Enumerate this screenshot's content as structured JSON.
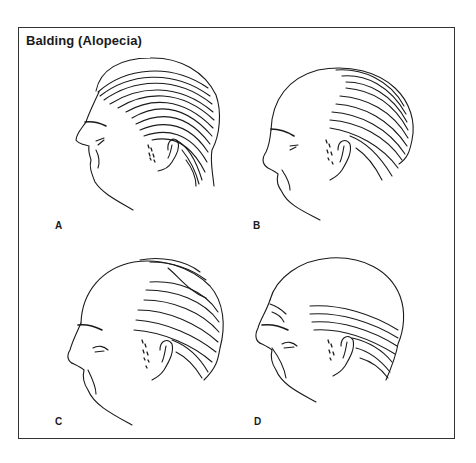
{
  "figure": {
    "title": "Balding (Alopecia)",
    "panels": [
      {
        "label": "A",
        "description": "full head of hair"
      },
      {
        "label": "B",
        "description": "receding hairline, bald crown front"
      },
      {
        "label": "C",
        "description": "advanced balding, thin strands on top"
      },
      {
        "label": "D",
        "description": "complete top baldness, hair fringe at sides and back"
      }
    ]
  }
}
